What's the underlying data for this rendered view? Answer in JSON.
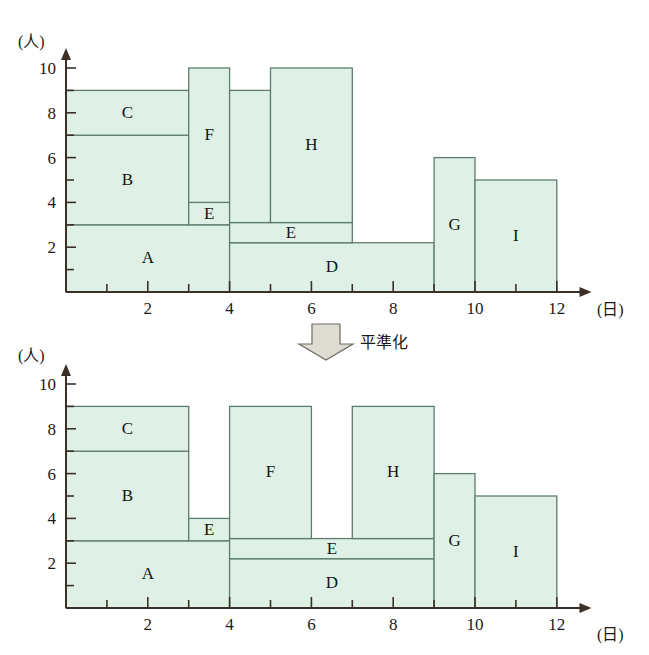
{
  "figure": {
    "transition_label": "平準化",
    "transition_icon": "down-arrow-icon"
  },
  "axes": {
    "y_caption": "(人)",
    "x_caption": "(日)",
    "y_ticks": [
      "2",
      "4",
      "6",
      "8",
      "10"
    ],
    "x_ticks": [
      "2",
      "4",
      "6",
      "8",
      "10",
      "12"
    ],
    "y_minor_ticks": [
      "1",
      "3",
      "5",
      "7",
      "9"
    ],
    "x_minor_ticks": [
      "1",
      "3",
      "5",
      "7",
      "9",
      "11"
    ]
  },
  "colors": {
    "block_fill": "#dff0e6",
    "block_stroke": "#5f7d6e",
    "axis": "#3a3028",
    "arrow_fill": "#dedbd2",
    "arrow_stroke": "#6f6d63",
    "text": "#1a1a1a",
    "background": "#ffffff"
  },
  "chart_data": [
    {
      "type": "area",
      "id": "before-leveling",
      "title": "",
      "xlabel": "(日)",
      "ylabel": "(人)",
      "xlim": [
        0,
        12.8
      ],
      "ylim": [
        0,
        10.8
      ],
      "grid": false,
      "legend": "none",
      "blocks": [
        {
          "label": "A",
          "x0": 0,
          "x1": 4,
          "y0": 0,
          "y1": 3
        },
        {
          "label": "B",
          "x0": 0,
          "x1": 3,
          "y0": 3,
          "y1": 7
        },
        {
          "label": "C",
          "x0": 0,
          "x1": 3,
          "y0": 7,
          "y1": 9
        },
        {
          "label": "E",
          "x0": 3,
          "x1": 4,
          "y0": 3,
          "y1": 4
        },
        {
          "label": "F",
          "x0": 3,
          "x1": 4,
          "y0": 4,
          "y1": 10
        },
        {
          "label": "D",
          "x0": 4,
          "x1": 9,
          "y0": 0,
          "y1": 2.2
        },
        {
          "label": "E",
          "x0": 4,
          "x1": 7,
          "y0": 2.2,
          "y1": 3.1
        },
        {
          "label": "",
          "x0": 4,
          "x1": 5,
          "y0": 3.1,
          "y1": 9
        },
        {
          "label": "H",
          "x0": 5,
          "x1": 7,
          "y0": 3.1,
          "y1": 10
        },
        {
          "label": "G",
          "x0": 9,
          "x1": 10,
          "y0": 0,
          "y1": 6
        },
        {
          "label": "I",
          "x0": 10,
          "x1": 12,
          "y0": 0,
          "y1": 5
        }
      ]
    },
    {
      "type": "area",
      "id": "after-leveling",
      "title": "",
      "xlabel": "(日)",
      "ylabel": "(人)",
      "xlim": [
        0,
        12.8
      ],
      "ylim": [
        0,
        10.8
      ],
      "grid": false,
      "legend": "none",
      "blocks": [
        {
          "label": "A",
          "x0": 0,
          "x1": 4,
          "y0": 0,
          "y1": 3
        },
        {
          "label": "B",
          "x0": 0,
          "x1": 3,
          "y0": 3,
          "y1": 7
        },
        {
          "label": "C",
          "x0": 0,
          "x1": 3,
          "y0": 7,
          "y1": 9
        },
        {
          "label": "E",
          "x0": 3,
          "x1": 4,
          "y0": 3,
          "y1": 4
        },
        {
          "label": "D",
          "x0": 4,
          "x1": 9,
          "y0": 0,
          "y1": 2.2
        },
        {
          "label": "E",
          "x0": 4,
          "x1": 9,
          "y0": 2.2,
          "y1": 3.1
        },
        {
          "label": "F",
          "x0": 4,
          "x1": 6,
          "y0": 3.1,
          "y1": 9
        },
        {
          "label": "H",
          "x0": 7,
          "x1": 9,
          "y0": 3.1,
          "y1": 9
        },
        {
          "label": "G",
          "x0": 9,
          "x1": 10,
          "y0": 0,
          "y1": 6
        },
        {
          "label": "I",
          "x0": 10,
          "x1": 12,
          "y0": 0,
          "y1": 5
        }
      ]
    }
  ]
}
